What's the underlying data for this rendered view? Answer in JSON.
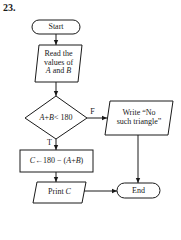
{
  "figure": {
    "number": "23."
  },
  "flowchart": {
    "start": {
      "label": "Start"
    },
    "input": {
      "line1": "Read the",
      "line2": "values of",
      "line3_var1": "A",
      "line3_and": " and ",
      "line3_var2": "B"
    },
    "decision": {
      "var1": "A",
      "plus": "+",
      "var2": "B",
      "rest": "< 180",
      "false_label": "F",
      "true_label": "T"
    },
    "output_false": {
      "line1": "Write “No",
      "line2": "such triangle”"
    },
    "process": {
      "var_c": "C",
      "assign": "←180 − (",
      "var_a": "A",
      "plus": "+",
      "var_b": "B",
      "close": ")"
    },
    "output_true": {
      "print": "Print ",
      "var_c": "C"
    },
    "end": {
      "label": "End"
    }
  },
  "colors": {
    "stroke": "#1a1a1a",
    "background": "#ffffff"
  }
}
